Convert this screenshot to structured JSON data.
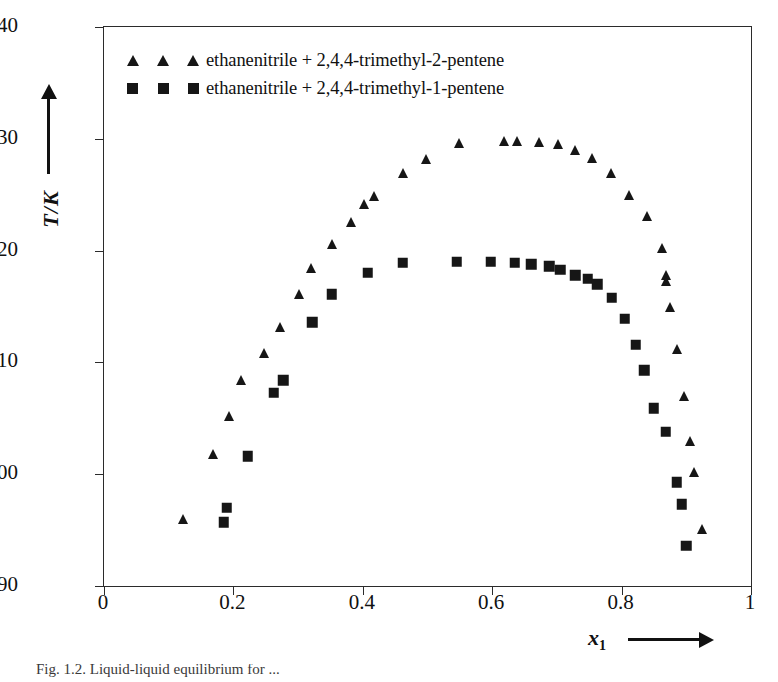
{
  "chart_data": {
    "type": "scatter",
    "title": "",
    "xlabel": "x_1",
    "ylabel": "T/K",
    "xlim": [
      0,
      1
    ],
    "ylim": [
      290,
      340
    ],
    "xticks": [
      "0",
      "0.2",
      "0.4",
      "0.6",
      "0.8",
      "1"
    ],
    "xtick_values": [
      0,
      0.2,
      0.4,
      0.6,
      0.8,
      1
    ],
    "yticks": [
      "290",
      "300",
      "310",
      "320",
      "330",
      "340"
    ],
    "ytick_values": [
      290,
      300,
      310,
      320,
      330,
      340
    ],
    "grid": false,
    "legend_position": "top-left",
    "series": [
      {
        "name": "ethanenitrile + 2,4,4-trimethyl-2-pentene",
        "marker": "triangle",
        "color": "#161616",
        "points": [
          [
            0.122,
            296.0
          ],
          [
            0.168,
            301.8
          ],
          [
            0.193,
            305.2
          ],
          [
            0.212,
            308.4
          ],
          [
            0.248,
            310.8
          ],
          [
            0.272,
            313.2
          ],
          [
            0.302,
            316.1
          ],
          [
            0.32,
            318.4
          ],
          [
            0.352,
            320.6
          ],
          [
            0.382,
            322.6
          ],
          [
            0.402,
            324.2
          ],
          [
            0.417,
            324.9
          ],
          [
            0.462,
            326.9
          ],
          [
            0.497,
            328.2
          ],
          [
            0.548,
            329.6
          ],
          [
            0.618,
            329.8
          ],
          [
            0.638,
            329.8
          ],
          [
            0.672,
            329.7
          ],
          [
            0.702,
            329.5
          ],
          [
            0.728,
            329.0
          ],
          [
            0.755,
            328.3
          ],
          [
            0.783,
            326.9
          ],
          [
            0.812,
            325.0
          ],
          [
            0.84,
            323.1
          ],
          [
            0.862,
            320.2
          ],
          [
            0.868,
            317.8
          ],
          [
            0.869,
            317.3
          ],
          [
            0.875,
            315.0
          ],
          [
            0.885,
            311.2
          ],
          [
            0.897,
            307.0
          ],
          [
            0.905,
            303.0
          ],
          [
            0.912,
            300.2
          ],
          [
            0.925,
            295.1
          ]
        ]
      },
      {
        "name": "ethanenitrile + 2,4,4-trimethyl-1-pentene",
        "marker": "square",
        "color": "#161616",
        "points": [
          [
            0.185,
            295.7
          ],
          [
            0.19,
            297.0
          ],
          [
            0.222,
            301.6
          ],
          [
            0.262,
            307.3
          ],
          [
            0.277,
            308.4
          ],
          [
            0.322,
            313.6
          ],
          [
            0.352,
            316.1
          ],
          [
            0.408,
            318.0
          ],
          [
            0.462,
            318.9
          ],
          [
            0.545,
            319.0
          ],
          [
            0.598,
            319.0
          ],
          [
            0.635,
            318.9
          ],
          [
            0.66,
            318.8
          ],
          [
            0.688,
            318.6
          ],
          [
            0.705,
            318.3
          ],
          [
            0.728,
            317.8
          ],
          [
            0.748,
            317.5
          ],
          [
            0.762,
            317.0
          ],
          [
            0.785,
            315.8
          ],
          [
            0.805,
            313.9
          ],
          [
            0.822,
            311.6
          ],
          [
            0.835,
            309.3
          ],
          [
            0.85,
            305.9
          ],
          [
            0.868,
            303.8
          ],
          [
            0.885,
            299.3
          ],
          [
            0.893,
            297.3
          ],
          [
            0.9,
            293.6
          ]
        ]
      }
    ]
  },
  "axes": {
    "y_title": "T/K",
    "x_title": "x",
    "x_title_sub": "1"
  },
  "legend": {
    "entries": [
      {
        "label": "ethanenitrile + 2,4,4-trimethyl-2-pentene",
        "marker": "triangle-icon"
      },
      {
        "label": "ethanenitrile + 2,4,4-trimethyl-1-pentene",
        "marker": "square-icon"
      }
    ]
  },
  "caption": {
    "text": "Fig. 1.2. Liquid-liquid equilibrium for ..."
  }
}
